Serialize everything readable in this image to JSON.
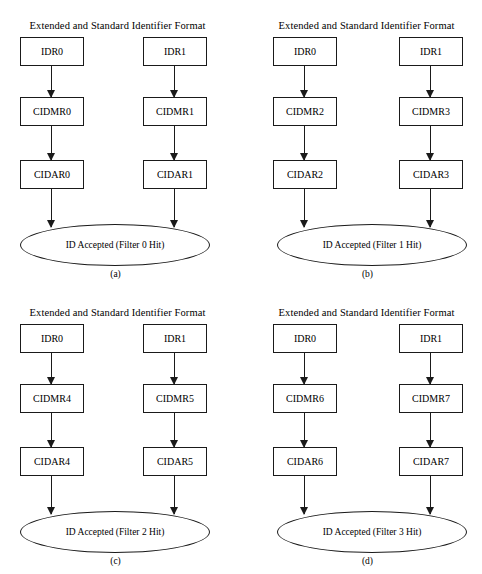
{
  "figure": {
    "title_common": "Extended and Standard Identifier Format",
    "panels": [
      {
        "key": "a",
        "label": "(a)",
        "title": "Extended and Standard Identifier Format",
        "left_chain": [
          "IDR0",
          "CIDMR0",
          "CIDAR0"
        ],
        "right_chain": [
          "IDR1",
          "CIDMR1",
          "CIDAR1"
        ],
        "result": "ID Accepted (Filter 0 Hit)"
      },
      {
        "key": "b",
        "label": "(b)",
        "title": "Extended and Standard Identifier Format",
        "left_chain": [
          "IDR0",
          "CIDMR2",
          "CIDAR2"
        ],
        "right_chain": [
          "IDR1",
          "CIDMR3",
          "CIDAR3"
        ],
        "result": "ID Accepted (Filter 1 Hit)"
      },
      {
        "key": "c",
        "label": "(c)",
        "title": "Extended and Standard Identifier Format",
        "left_chain": [
          "IDR0",
          "CIDMR4",
          "CIDAR4"
        ],
        "right_chain": [
          "IDR1",
          "CIDMR5",
          "CIDAR5"
        ],
        "result": "ID Accepted (Filter 2 Hit)"
      },
      {
        "key": "d",
        "label": "(d)",
        "title": "Extended and Standard Identifier Format",
        "left_chain": [
          "IDR0",
          "CIDMR6",
          "CIDAR6"
        ],
        "right_chain": [
          "IDR1",
          "CIDMR7",
          "CIDAR7"
        ],
        "result": "ID Accepted (Filter 3 Hit)"
      }
    ]
  },
  "colors": {
    "stroke": "#1a1a1a",
    "background": "#ffffff",
    "text": "#000000"
  }
}
